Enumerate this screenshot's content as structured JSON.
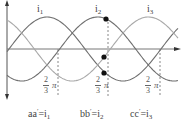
{
  "diagram": {
    "curves": [
      {
        "id": "i1",
        "label": "i",
        "sub": "1",
        "color": "#6f6f6f",
        "phase_shift_deg": 0
      },
      {
        "id": "i2",
        "label": "i",
        "sub": "2",
        "color": "#6f6f6f",
        "phase_shift_deg": 120
      },
      {
        "id": "i3",
        "label": "i",
        "sub": "3",
        "color": "#a9a9a9",
        "phase_shift_deg": 240
      }
    ],
    "phase_marks": [
      {
        "num": "2",
        "den": "3",
        "symbol": "π"
      },
      {
        "num": "2",
        "den": "3",
        "symbol": "π"
      },
      {
        "num": "2",
        "den": "3",
        "symbol": "π"
      }
    ],
    "bottom_labels": [
      {
        "coil": "aa",
        "prime": "′",
        "eq": "=i",
        "sub": "1"
      },
      {
        "coil": "bb",
        "prime": "′",
        "eq": "=i",
        "sub": "2"
      },
      {
        "coil": "cc",
        "prime": "′",
        "eq": "=i",
        "sub": "3"
      }
    ],
    "markers": [
      {
        "x": 106,
        "y": 19
      },
      {
        "x": 104,
        "y": 57
      },
      {
        "x": 104,
        "y": 73
      }
    ],
    "colors": {
      "axis": "#555555",
      "dashed": "#888888",
      "marker": "#111111"
    }
  }
}
